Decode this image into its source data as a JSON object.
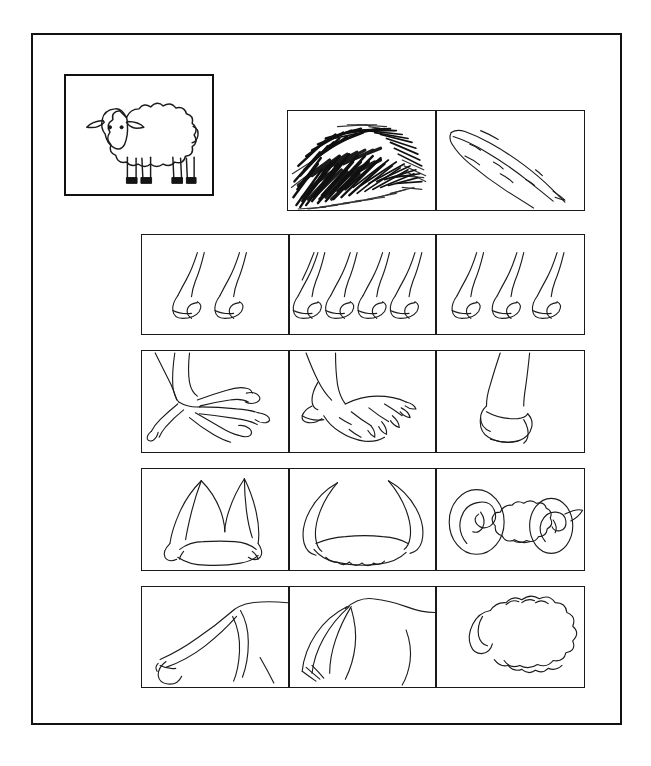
{
  "document": {
    "title": "Animal Features Identification Sheet",
    "background_color": "#ffffff",
    "ink_color": "#1b1b1b",
    "border_color": "#121212"
  },
  "reference": {
    "panel_name": "reference-animal-panel",
    "subject": "sheep",
    "description": "Line drawing of a woolly sheep standing in profile facing left, with ears, two visible eyes, and four legs ending in dark hooves"
  },
  "covering_row": {
    "row_label": "body covering",
    "panels": [
      {
        "id": "fur",
        "icon": "fur-texture-icon",
        "description": "Dense black hatched fur or hair texture patch"
      },
      {
        "id": "feather",
        "icon": "feather-icon",
        "description": "Single quill feather drawn in outline, tip pointing down-right"
      }
    ]
  },
  "feature_rows": [
    {
      "row_id": "legs-row",
      "row_label": "number of legs",
      "panels": [
        {
          "id": "legs-two",
          "icon": "two-legs-icon",
          "count": 2,
          "description": "Two hoofed legs"
        },
        {
          "id": "legs-four",
          "icon": "four-legs-icon",
          "count": 4,
          "description": "Four hoofed legs"
        },
        {
          "id": "legs-three",
          "icon": "three-legs-icon",
          "count": 3,
          "description": "Three hoofed legs"
        }
      ]
    },
    {
      "row_id": "feet-row",
      "row_label": "foot type",
      "panels": [
        {
          "id": "foot-claw",
          "icon": "bird-foot-icon",
          "description": "Bird foot with three forward toes and one rear toe, each with a claw"
        },
        {
          "id": "foot-paw",
          "icon": "clawed-paw-icon",
          "description": "Mammal paw with toes and curved claws plus a dewclaw"
        },
        {
          "id": "foot-hoof",
          "icon": "hoof-icon",
          "description": "Single cloven hoof at the end of a leg"
        }
      ]
    },
    {
      "row_id": "horns-row",
      "row_label": "horn type",
      "panels": [
        {
          "id": "horns-upright",
          "icon": "upright-horns-icon",
          "description": "Pair of tall upright horns curving outward from the head"
        },
        {
          "id": "horns-curved",
          "icon": "crescent-horns-icon",
          "description": "Pair of wide crescent horns sweeping up and outward"
        },
        {
          "id": "horns-spiral",
          "icon": "spiral-ram-horns-icon",
          "description": "Ram head front view with two large spiral curled horns and ears"
        }
      ]
    },
    {
      "row_id": "tails-row",
      "row_label": "tail type",
      "panels": [
        {
          "id": "tail-thin",
          "icon": "thin-tail-icon",
          "description": "Long thin tail with a small tuft, hanging from the rump"
        },
        {
          "id": "tail-tufted",
          "icon": "tufted-tail-icon",
          "description": "Long flowing horse-like tail with brushed hair strands"
        },
        {
          "id": "tail-woolly",
          "icon": "woolly-tail-icon",
          "description": "Short woolly sheep tail against a fleecy rump"
        }
      ]
    }
  ]
}
